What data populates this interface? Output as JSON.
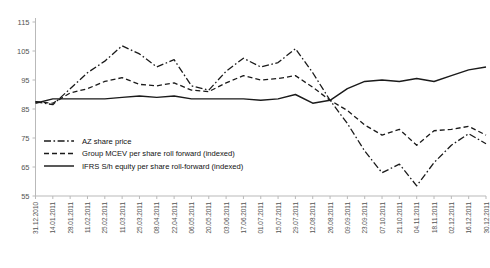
{
  "chart_data": {
    "type": "line",
    "title": "",
    "subtitle": "",
    "xlabel": "",
    "ylabel": "",
    "ylim": [
      55,
      115
    ],
    "yticks": [
      55,
      65,
      75,
      85,
      95,
      105,
      115
    ],
    "grid": false,
    "legend_position": "inside-bottom-left",
    "x": [
      "31.12.2010",
      "14.01.2011",
      "28.01.2011",
      "11.02.2011",
      "25.02.2011",
      "11.03.2011",
      "25.03.2011",
      "08.04.2011",
      "22.04.2011",
      "06.05.2011",
      "20.05.2011",
      "03.06.2011",
      "17.06.2011",
      "01.07.2011",
      "15.07.2011",
      "29.07.2011",
      "12.08.2011",
      "26.08.2011",
      "09.09.2011",
      "23.09.2011",
      "07.10.2011",
      "21.10.2011",
      "04.11.2011",
      "18.11.2011",
      "02.12.2011",
      "16.12.2011",
      "30.12.2011"
    ],
    "series": [
      {
        "name": "AZ share price",
        "style": "dash-dot",
        "values": [
          87.5,
          86.5,
          92.0,
          97.5,
          101.5,
          106.8,
          104.0,
          99.5,
          102.0,
          93.0,
          91.5,
          98.0,
          102.5,
          99.5,
          101.0,
          105.8,
          97.5,
          88.0,
          80.0,
          70.5,
          63.0,
          66.0,
          58.5,
          66.5,
          72.5,
          76.5,
          73.0
        ],
        "labels_x": [
          "31.12.2010",
          "14.01.2011",
          "28.01.2011",
          "11.02.2011",
          "25.02.2011",
          "11.03.2011",
          "25.03.2011",
          "08.04.2011",
          "22.04.2011",
          "06.05.2011",
          "20.05.2011",
          "03.06.2011",
          "17.06.2011",
          "01.07.2011",
          "15.07.2011",
          "29.07.2011",
          "12.08.2011",
          "26.08.2011",
          "09.09.2011",
          "23.09.2011",
          "07.10.2011",
          "21.10.2011",
          "04.11.2011",
          "18.11.2011",
          "02.12.2011",
          "16.12.2011",
          "30.12.2011"
        ]
      },
      {
        "name": "Group MCEV per share roll forward (indexed)",
        "style": "dashed",
        "values": [
          87.5,
          87.0,
          90.5,
          92.0,
          94.5,
          95.8,
          93.5,
          93.0,
          94.0,
          91.5,
          91.0,
          94.0,
          96.5,
          95.0,
          95.5,
          96.5,
          92.5,
          88.0,
          84.5,
          79.5,
          76.0,
          78.0,
          72.5,
          77.5,
          78.0,
          79.0,
          76.0
        ],
        "labels_x": [
          "31.12.2010",
          "14.01.2011",
          "28.01.2011",
          "11.02.2011",
          "25.02.2011",
          "11.03.2011",
          "25.03.2011",
          "08.04.2011",
          "22.04.2011",
          "06.05.2011",
          "20.05.2011",
          "03.06.2011",
          "17.06.2011",
          "01.07.2011",
          "15.07.2011",
          "29.07.2011",
          "12.08.2011",
          "26.08.2011",
          "09.09.2011",
          "23.09.2011",
          "07.10.2011",
          "21.10.2011",
          "04.11.2011",
          "18.11.2011",
          "02.12.2011",
          "16.12.2011",
          "30.12.2011"
        ]
      },
      {
        "name": "IFRS S/h equity per share roll-forward (indexed)",
        "style": "solid",
        "values": [
          87.0,
          88.5,
          88.5,
          88.5,
          88.5,
          89.0,
          89.5,
          89.0,
          89.5,
          88.5,
          88.5,
          88.5,
          88.5,
          88.0,
          88.5,
          90.0,
          87.0,
          88.0,
          92.0,
          94.5,
          95.0,
          94.5,
          95.5,
          94.5,
          96.5,
          98.5,
          99.5
        ],
        "labels_x": [
          "31.12.2010",
          "14.01.2011",
          "28.01.2011",
          "11.02.2011",
          "25.02.2011",
          "11.03.2011",
          "25.03.2011",
          "08.04.2011",
          "22.04.2011",
          "06.05.2011",
          "20.05.2011",
          "03.06.2011",
          "17.06.2011",
          "01.07.2011",
          "15.07.2011",
          "29.07.2011",
          "12.08.2011",
          "26.08.2011",
          "09.09.2011",
          "23.09.2011",
          "07.10.2011",
          "21.10.2011",
          "04.11.2011",
          "18.11.2011",
          "02.12.2011",
          "16.12.2011",
          "30.12.2011"
        ]
      }
    ]
  },
  "legend": {
    "items": [
      {
        "label": "AZ share price"
      },
      {
        "label": "Group MCEV per share roll forward (indexed)"
      },
      {
        "label": "IFRS S/h equity per share roll-forward (indexed)"
      }
    ]
  },
  "colors": {
    "series_stroke": "#1a1a1a",
    "axis": "#b9b9b9",
    "tick_text": "#555555",
    "legend_text": "#111111",
    "background": "#ffffff"
  }
}
